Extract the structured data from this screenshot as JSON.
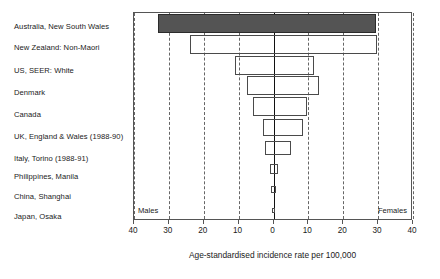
{
  "chart_data": {
    "type": "bar",
    "orientation": "horizontal-diverging",
    "title": "",
    "xlabel": "Age-standardised incidence rate per 100,000",
    "ylabel": "",
    "xlim": [
      -40,
      40
    ],
    "grid": true,
    "grid_style": "dashed-vertical",
    "tick_values": [
      -40,
      -30,
      -20,
      -10,
      0,
      10,
      20,
      30,
      40
    ],
    "tick_labels": [
      "40",
      "30",
      "20",
      "10",
      "0",
      "10",
      "20",
      "30",
      "40"
    ],
    "side_labels": {
      "left": "Males",
      "right": "Females"
    },
    "legend": "none",
    "categories": [
      "Australia, New South Wales",
      "New Zealand: Non-Maori",
      "US, SEER: White",
      "Denmark",
      "Canada",
      "UK, England & Wales (1988-90)",
      "Italy, Torino (1988-91)",
      "Philippines, Manila",
      "China, Shanghai",
      "Japan, Osaka"
    ],
    "series": [
      {
        "name": "Males",
        "values": [
          33.0,
          24.0,
          11.0,
          7.5,
          6.0,
          3.0,
          2.5,
          1.0,
          0.6,
          0.4
        ]
      },
      {
        "name": "Females",
        "values": [
          29.5,
          29.8,
          11.7,
          13.0,
          9.5,
          8.5,
          5.0,
          1.2,
          0.7,
          0.4
        ]
      }
    ],
    "highlighted_category": "Australia, New South Wales",
    "colors": {
      "highlight_fill": "#545454",
      "bar_outline": "#4a4a4a",
      "frame": "#555555",
      "gridline": "#666666",
      "zero_line": "#111111",
      "text": "#1a1a1a",
      "background": "#ffffff"
    }
  }
}
